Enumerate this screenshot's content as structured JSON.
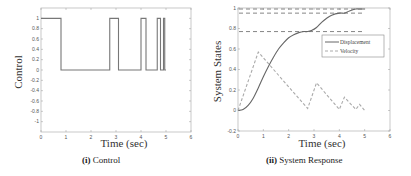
{
  "chart_data": [
    {
      "type": "line",
      "title": "",
      "caption": {
        "prefix": "(i)",
        "text": "Control"
      },
      "xlabel": "Time (sec)",
      "ylabel": "Control",
      "xlim": [
        0,
        6
      ],
      "ylim": [
        -1.2,
        1.2
      ],
      "xticks": [
        "0",
        "1",
        "2",
        "3",
        "4",
        "5",
        "6"
      ],
      "yticks": [
        "1",
        "0.8",
        "0.6",
        "0.4",
        "0.2",
        "0",
        "-0.2",
        "-0.4",
        "-0.6",
        "-0.8",
        "-1"
      ],
      "grid": false,
      "series": [
        {
          "name": "Control",
          "style": "solid",
          "color": "#777777",
          "x": [
            0,
            0.8,
            0.8,
            2.75,
            2.75,
            3.1,
            3.1,
            4.0,
            4.0,
            4.2,
            4.2,
            4.65,
            4.65,
            4.78,
            4.78,
            4.9,
            4.9,
            4.95,
            4.95,
            5.0
          ],
          "y": [
            1,
            1,
            0,
            0,
            1,
            1,
            0,
            0,
            1,
            1,
            0,
            0,
            1,
            1,
            0,
            0,
            1,
            1,
            0,
            0
          ]
        }
      ]
    },
    {
      "type": "line",
      "title": "",
      "caption": {
        "prefix": "(ii)",
        "text": "System Response"
      },
      "xlabel": "Time (sec)",
      "ylabel": "System States",
      "xlim": [
        0,
        6
      ],
      "ylim": [
        -0.2,
        1.0
      ],
      "xticks": [
        "0",
        "1",
        "2",
        "3",
        "4",
        "5",
        "6"
      ],
      "yticks": [
        "1",
        "0.8",
        "0.6",
        "0.4",
        "0.2",
        "0",
        "-0.2"
      ],
      "grid": false,
      "legend": {
        "position": "upper right",
        "entries": [
          "Displacement",
          "Velocity"
        ]
      },
      "reference_lines": [
        0.99,
        0.95,
        0.77
      ],
      "series": [
        {
          "name": "Displacement",
          "style": "solid",
          "color": "#666666",
          "x": [
            0,
            0.2,
            0.4,
            0.6,
            0.8,
            1.0,
            1.2,
            1.4,
            1.6,
            1.8,
            2.0,
            2.2,
            2.4,
            2.6,
            2.75,
            2.9,
            3.1,
            3.3,
            3.5,
            3.7,
            4.0,
            4.2,
            4.4,
            4.65,
            4.8,
            5.0
          ],
          "y": [
            0,
            0.01,
            0.05,
            0.12,
            0.22,
            0.33,
            0.43,
            0.52,
            0.6,
            0.66,
            0.71,
            0.74,
            0.76,
            0.77,
            0.77,
            0.78,
            0.81,
            0.86,
            0.9,
            0.93,
            0.95,
            0.95,
            0.97,
            0.99,
            0.99,
            0.99
          ]
        },
        {
          "name": "Velocity",
          "style": "dashed",
          "color": "#aaaaaa",
          "x": [
            0,
            0.8,
            2.75,
            3.1,
            4.0,
            4.2,
            4.65,
            4.8,
            5.0
          ],
          "y": [
            0,
            0.57,
            0.02,
            0.27,
            0.01,
            0.13,
            0.01,
            0.06,
            0.0
          ]
        }
      ]
    }
  ]
}
